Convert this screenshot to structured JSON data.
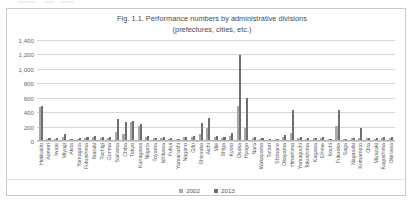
{
  "chart_title_line1": "Fig. 1.1. Performance numbers by administrative divisions",
  "chart_title_line2": "(prefectures, cities, etc.)",
  "legend": [
    {
      "label": "2002",
      "color": "#a9a9a9",
      "swatch": "square-swatch"
    },
    {
      "label": "2013",
      "color": "#6e6e6e",
      "swatch": "square-swatch"
    }
  ],
  "yaxis": {
    "ticks": [
      "1,400",
      "1,200",
      "1,000",
      "800",
      "600",
      "400",
      "200",
      "0"
    ],
    "min": 0,
    "max": 1400,
    "step": 200
  },
  "chart_data": {
    "type": "bar",
    "title": "Fig. 1.1. Performance numbers by administrative divisions (prefectures, cities, etc.)",
    "xlabel": "",
    "ylabel": "",
    "ylim": [
      0,
      1400
    ],
    "ytick_step": 200,
    "grid": true,
    "legend_position": "bottom",
    "categories": [
      "Hokkaido",
      "Aomori",
      "Iwate",
      "Miyagi",
      "Akita",
      "Yamagata",
      "Fukushima",
      "Ibaraki",
      "Tochigi",
      "Gunma",
      "Saitama",
      "Chiba",
      "Tokyo",
      "Kanagawa",
      "Niigata",
      "Toyama",
      "Ishikawa",
      "Fukui",
      "Yamanashi",
      "Nagano",
      "Gifu",
      "Shizuoka",
      "Aichi",
      "Mie",
      "Shiga",
      "Kyoto",
      "Osaka",
      "Hyogo",
      "Nara",
      "Wakayama",
      "Tottori",
      "Shimane",
      "Okayama",
      "Hiroshima",
      "Yamaguchi",
      "Tokushima",
      "Kagawa",
      "Ehime",
      "Kochi",
      "Fukuoka",
      "Saga",
      "Nagasaki",
      "Kumamoto",
      "Oita",
      "Miyazaki",
      "Kagoshima",
      "Okinawa"
    ],
    "series": [
      {
        "name": "2002",
        "color": "#a9a9a9",
        "values": [
          470,
          30,
          25,
          60,
          25,
          30,
          45,
          55,
          40,
          45,
          130,
          95,
          270,
          215,
          55,
          35,
          40,
          30,
          25,
          50,
          55,
          95,
          175,
          50,
          40,
          70,
          480,
          180,
          45,
          30,
          20,
          25,
          60,
          105,
          45,
          30,
          35,
          45,
          25,
          210,
          25,
          35,
          45,
          35,
          30,
          45,
          40
        ]
      },
      {
        "name": "2013",
        "color": "#6e6e6e",
        "values": [
          490,
          40,
          35,
          95,
          30,
          40,
          60,
          75,
          55,
          60,
          310,
          265,
          280,
          230,
          70,
          45,
          50,
          35,
          30,
          60,
          70,
          245,
          320,
          65,
          50,
          105,
          1190,
          590,
          60,
          40,
          25,
          30,
          85,
          430,
          55,
          35,
          45,
          60,
          30,
          435,
          30,
          45,
          175,
          45,
          40,
          60,
          55
        ]
      }
    ]
  }
}
